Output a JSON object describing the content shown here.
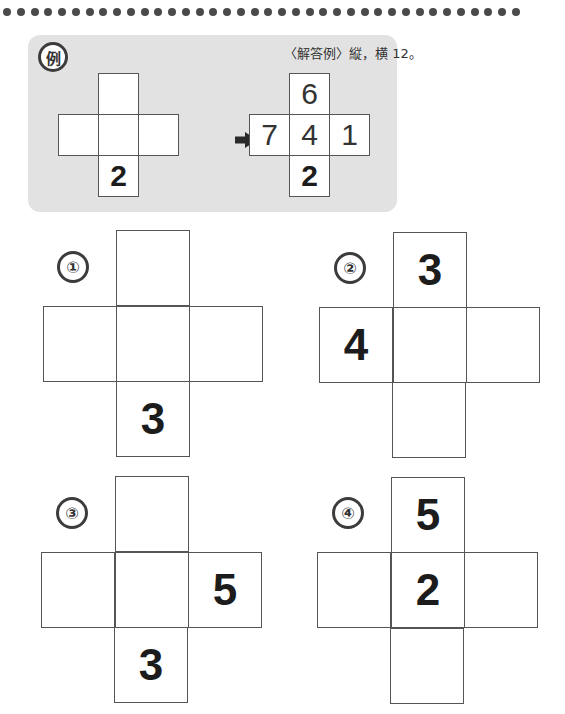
{
  "decoration": {
    "dot_count": 38,
    "dot_color": "#4a4a4a"
  },
  "example": {
    "badge": "例",
    "note": "〈解答例〉縦，横 12。",
    "background_color": "#e2e2e2",
    "problem": {
      "top": "",
      "left": "",
      "center": "",
      "right": "",
      "bottom": "2"
    },
    "arrow": "➡",
    "answer": {
      "top": "6",
      "left": "7",
      "center": "4",
      "right": "1",
      "bottom": "2"
    },
    "row_sum": 12,
    "column_sum": 12
  },
  "puzzles": [
    {
      "label": "①",
      "cells": {
        "top": "",
        "left": "",
        "center": "",
        "right": "",
        "bottom": "3"
      }
    },
    {
      "label": "②",
      "cells": {
        "top": "3",
        "left": "4",
        "center": "",
        "right": "",
        "bottom": ""
      }
    },
    {
      "label": "③",
      "cells": {
        "top": "",
        "left": "",
        "center": "",
        "right": "5",
        "bottom": "3"
      }
    },
    {
      "label": "④",
      "cells": {
        "top": "5",
        "left": "",
        "center": "2",
        "right": "",
        "bottom": ""
      }
    }
  ]
}
